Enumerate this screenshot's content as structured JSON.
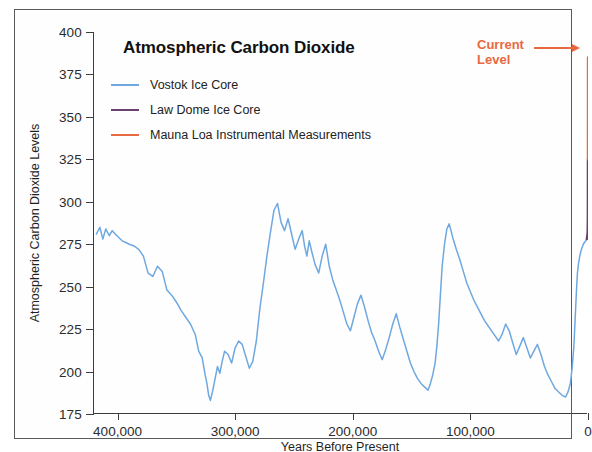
{
  "chart_data": {
    "type": "line",
    "title": "Atmospheric Carbon Dioxide",
    "xlabel": "Years Before Present",
    "ylabel": "Atmospheric Carbon Dioxide Levels",
    "xlim": [
      420000,
      0
    ],
    "ylim": [
      175,
      400
    ],
    "x_reversed": true,
    "grid": false,
    "legend_position": "upper-left-inside",
    "x_ticks": [
      400000,
      300000,
      200000,
      100000,
      0
    ],
    "x_tick_labels": [
      "400,000",
      "300,000",
      "200,000",
      "100,000",
      "0"
    ],
    "y_ticks": [
      175,
      200,
      225,
      250,
      275,
      300,
      325,
      350,
      375,
      400
    ],
    "y_tick_labels": [
      "175",
      "200",
      "225",
      "250",
      "275",
      "300",
      "325",
      "350",
      "375",
      "400"
    ],
    "annotations": [
      {
        "name": "current-level",
        "text": "Current\nLevel",
        "text_line_1": "Current",
        "text_line_2": "Level",
        "color": "#e8693f",
        "arrow": "right",
        "points_to_x": 0,
        "points_to_y": 385
      }
    ],
    "series": [
      {
        "name": "Vostok Ice Core",
        "color": "#6fa8e0",
        "x": [
          418000,
          415000,
          412500,
          410000,
          407000,
          404500,
          402000,
          399000,
          396000,
          393000,
          390000,
          386000,
          382000,
          378000,
          374000,
          370000,
          366000,
          362000,
          358000,
          354000,
          350000,
          346000,
          342000,
          338000,
          334000,
          331000,
          328000,
          325500,
          324000,
          322500,
          321000,
          319000,
          317000,
          315000,
          313000,
          311000,
          309000,
          306000,
          303000,
          300000,
          297000,
          294000,
          291000,
          288000,
          285000,
          282000,
          279000,
          276000,
          273000,
          270000,
          267000,
          264000,
          261000,
          258000,
          255000,
          252000,
          249000,
          246000,
          243000,
          241000,
          239000,
          237000,
          235000,
          232000,
          229000,
          226000,
          223000,
          220000,
          217000,
          214000,
          211000,
          208000,
          205000,
          202000,
          199000,
          196000,
          193000,
          190000,
          187000,
          184000,
          181000,
          178000,
          175000,
          172000,
          169000,
          166000,
          163000,
          160000,
          157000,
          154000,
          151000,
          148000,
          145000,
          142000,
          139000,
          136000,
          134000,
          132000,
          130000,
          128500,
          127000,
          125500,
          124000,
          122000,
          120000,
          118000,
          115000,
          112000,
          109000,
          106000,
          103000,
          100000,
          97000,
          94000,
          91000,
          88000,
          85000,
          82000,
          79000,
          76000,
          73000,
          70000,
          67000,
          64000,
          61000,
          58000,
          55000,
          52000,
          49000,
          46000,
          43000,
          40000,
          37000,
          34000,
          31000,
          28000,
          25000,
          22000,
          19000,
          17000,
          15000,
          13500,
          12000,
          11000,
          10000,
          9000,
          8000,
          7000,
          6000,
          5000,
          4000,
          3000,
          2000,
          1000
        ],
        "y": [
          281,
          285,
          278,
          284,
          280,
          283,
          281,
          279,
          277,
          276,
          275,
          274,
          272,
          268,
          258,
          256,
          262,
          259,
          248,
          245,
          241,
          236,
          232,
          228,
          222,
          212,
          208,
          198,
          193,
          186,
          183,
          189,
          196,
          203,
          199,
          206,
          212,
          210,
          205,
          214,
          218,
          216,
          209,
          202,
          206,
          218,
          237,
          252,
          268,
          282,
          295,
          299,
          288,
          283,
          290,
          281,
          272,
          278,
          283,
          274,
          268,
          277,
          271,
          263,
          258,
          268,
          275,
          262,
          254,
          248,
          242,
          235,
          228,
          224,
          232,
          240,
          245,
          238,
          230,
          223,
          218,
          212,
          207,
          213,
          220,
          228,
          234,
          226,
          219,
          212,
          205,
          200,
          196,
          193,
          191,
          189,
          193,
          198,
          205,
          215,
          228,
          245,
          262,
          275,
          284,
          287,
          279,
          272,
          266,
          259,
          252,
          247,
          242,
          238,
          234,
          230,
          227,
          224,
          221,
          218,
          222,
          228,
          224,
          217,
          210,
          215,
          220,
          214,
          208,
          212,
          216,
          210,
          203,
          198,
          194,
          190,
          188,
          186,
          185,
          188,
          193,
          202,
          215,
          230,
          245,
          258,
          264,
          268,
          271,
          273,
          275,
          276,
          277,
          278
        ]
      },
      {
        "name": "Law Dome Ice Core",
        "color": "#6b3f6e",
        "x": [
          1000,
          800,
          600,
          400,
          250,
          150,
          100,
          70,
          50
        ],
        "y": [
          278,
          279,
          280,
          281,
          283,
          290,
          300,
          312,
          325
        ]
      },
      {
        "name": "Mauna Loa Instrumental Measurements",
        "color": "#e8693f",
        "x": [
          50,
          40,
          30,
          20,
          10,
          5,
          0
        ],
        "y": [
          325,
          332,
          340,
          352,
          366,
          376,
          385
        ]
      }
    ]
  },
  "legend": {
    "items": [
      {
        "label": "Vostok Ice Core",
        "color": "#6fa8e0"
      },
      {
        "label": "Law Dome Ice Core",
        "color": "#6b3f6e"
      },
      {
        "label": "Mauna Loa Instrumental Measurements",
        "color": "#e8693f"
      }
    ]
  }
}
